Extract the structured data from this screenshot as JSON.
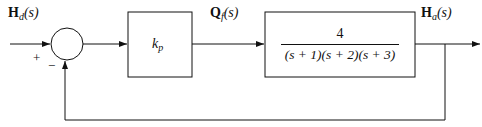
{
  "diagram": {
    "type": "block-diagram",
    "input_signal": {
      "main": "H",
      "sub": "d",
      "arg": "(s)"
    },
    "summing_junction": {
      "plus_sign": "+",
      "minus_sign": "−"
    },
    "controller_block": {
      "gain_main": "k",
      "gain_sub": "p"
    },
    "intermediate_signal": {
      "main": "Q",
      "sub": "f",
      "arg": "(s)"
    },
    "plant_block": {
      "numerator": "4",
      "denominator": "(s + 1)(s + 2)(s + 3)"
    },
    "output_signal": {
      "main": "H",
      "sub": "a",
      "arg": "(s)"
    },
    "feedback": "unity negative feedback"
  }
}
